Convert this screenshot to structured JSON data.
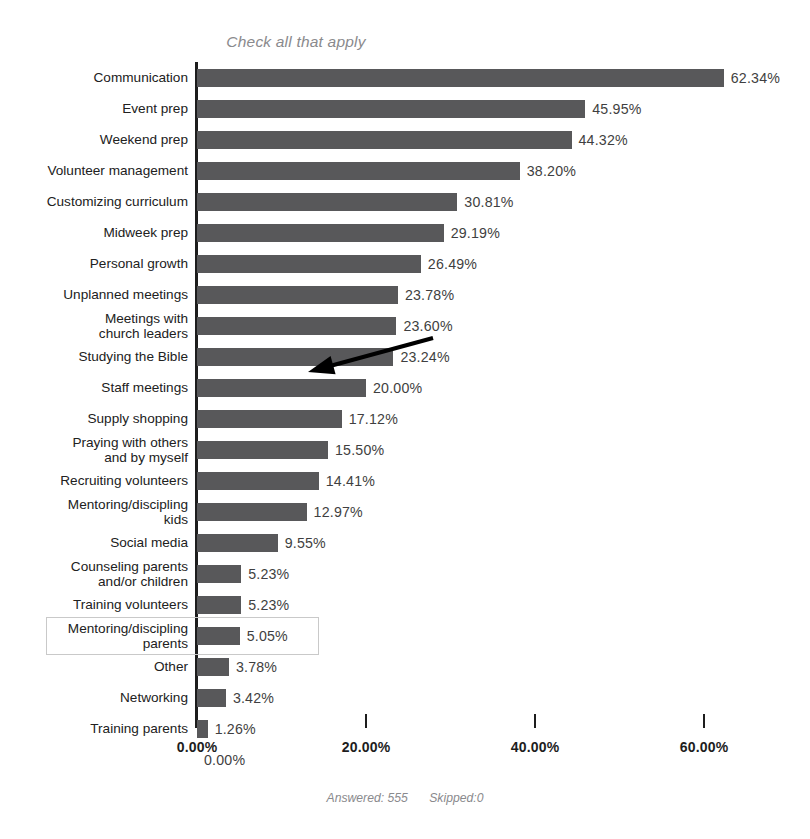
{
  "chart_data": {
    "type": "bar",
    "orientation": "horizontal",
    "title": "Check all that apply",
    "xlabel": "",
    "ylabel": "",
    "xlim": [
      0,
      65
    ],
    "xticks": [
      "0.00%",
      "20.00%",
      "40.00%",
      "60.00%"
    ],
    "xtick_values": [
      0,
      20,
      40,
      60
    ],
    "grid": false,
    "legend": null,
    "categories": [
      "Communication",
      "Event prep",
      "Weekend prep",
      "Volunteer management",
      "Customizing curriculum",
      "Midweek prep",
      "Personal growth",
      "Unplanned meetings",
      "Meetings with\nchurch leaders",
      "Studying the Bible",
      "Staff meetings",
      "Supply shopping",
      "Praying with others\nand by myself",
      "Recruiting volunteers",
      "Mentoring/discipling\nkids",
      "Social media",
      "Counseling parents\nand/or children",
      "Training volunteers",
      "Mentoring/discipling\nparents",
      "Other",
      "Networking",
      "Training parents",
      ""
    ],
    "values": [
      62.34,
      45.95,
      44.32,
      38.2,
      30.81,
      29.19,
      26.49,
      23.78,
      23.6,
      23.24,
      20.0,
      17.12,
      15.5,
      14.41,
      12.97,
      9.55,
      5.23,
      5.23,
      5.05,
      3.78,
      3.42,
      1.26,
      0.0
    ],
    "value_labels": [
      "62.34%",
      "45.95%",
      "44.32%",
      "38.20%",
      "30.81%",
      "29.19%",
      "26.49%",
      "23.78%",
      "23.60%",
      "23.24%",
      "20.00%",
      "17.12%",
      "15.50%",
      "14.41%",
      "12.97%",
      "9.55%",
      "5.23%",
      "5.23%",
      "5.05%",
      "3.78%",
      "3.42%",
      "1.26%",
      "0.00%"
    ],
    "bar_color": "#58585a",
    "highlighted_category": "Mentoring/discipling\nparents",
    "annotations": [
      {
        "type": "arrow",
        "points_to_category": "Staff meetings",
        "from": [
          433,
          338
        ],
        "to": [
          308,
          372
        ]
      }
    ]
  },
  "footer": {
    "answered": "Answered: 555",
    "skipped": "Skipped:0"
  }
}
